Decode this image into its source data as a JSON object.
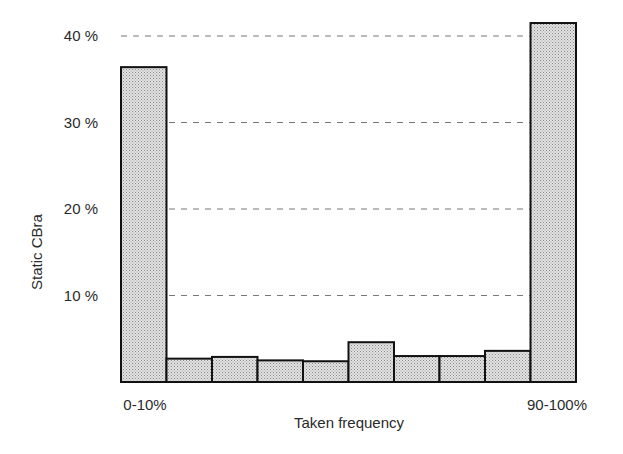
{
  "chart_data": {
    "type": "bar",
    "title": "",
    "xlabel": "Taken frequency",
    "ylabel": "Static CBra",
    "categories": [
      "0-10%",
      "10-20%",
      "20-30%",
      "30-40%",
      "40-50%",
      "50-60%",
      "60-70%",
      "70-80%",
      "80-90%",
      "90-100%"
    ],
    "visible_x_tick_labels": [
      "0-10%",
      "90-100%"
    ],
    "values": [
      36.4,
      2.7,
      2.9,
      2.5,
      2.4,
      4.6,
      3.0,
      3.0,
      3.6,
      41.5
    ],
    "y_ticks": [
      10,
      20,
      30,
      40
    ],
    "y_tick_labels": [
      "10 %",
      "20 %",
      "30 %",
      "40 %"
    ],
    "ylim": [
      0,
      44
    ],
    "grid": "horizontal dashed",
    "legend": null,
    "bar_fill": "#d4d4d4",
    "bar_stroke": "#111111"
  }
}
